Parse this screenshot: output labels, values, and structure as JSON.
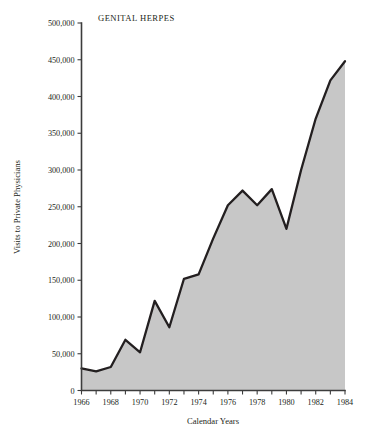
{
  "figure": {
    "title": "GENITAL HERPES",
    "x_axis_title": "Calendar Years",
    "y_axis_title": "Visits to Private Physicians"
  },
  "chart_data": {
    "type": "area",
    "title": "GENITAL HERPES",
    "xlabel": "Calendar Years",
    "ylabel": "Visits to Private Physicians",
    "xlim": [
      1966,
      1984
    ],
    "ylim": [
      0,
      500000
    ],
    "grid": false,
    "legend": "none",
    "x_tick_labels": [
      "1966",
      "1968",
      "1970",
      "1972",
      "1974",
      "1976",
      "1978",
      "1980",
      "1982",
      "1984"
    ],
    "x_tick_values": [
      1966,
      1968,
      1970,
      1972,
      1974,
      1976,
      1978,
      1980,
      1982,
      1984
    ],
    "x_minor_ticks": [
      1967,
      1969,
      1971,
      1973,
      1975,
      1977,
      1979,
      1981,
      1983
    ],
    "y_tick_labels": [
      "0",
      "50,000",
      "100,000",
      "150,000",
      "200,000",
      "250,000",
      "300,000",
      "350,000",
      "400,000",
      "450,000",
      "500,000"
    ],
    "y_tick_values": [
      0,
      50000,
      100000,
      150000,
      200000,
      250000,
      300000,
      350000,
      400000,
      450000,
      500000
    ],
    "series": [
      {
        "name": "Visits to Private Physicians",
        "x": [
          1966,
          1967,
          1968,
          1969,
          1970,
          1971,
          1972,
          1973,
          1974,
          1975,
          1976,
          1977,
          1978,
          1979,
          1980,
          1981,
          1982,
          1983,
          1984
        ],
        "values": [
          30000,
          26000,
          32000,
          69000,
          52000,
          122000,
          86000,
          152000,
          158000,
          207000,
          252000,
          272000,
          252000,
          274000,
          220000,
          300000,
          370000,
          422000,
          448000
        ]
      }
    ],
    "colors": {
      "area_fill": "#c7c7c7",
      "line": "#231f20",
      "axis": "#3c3c3c",
      "background": "#ffffff"
    }
  }
}
